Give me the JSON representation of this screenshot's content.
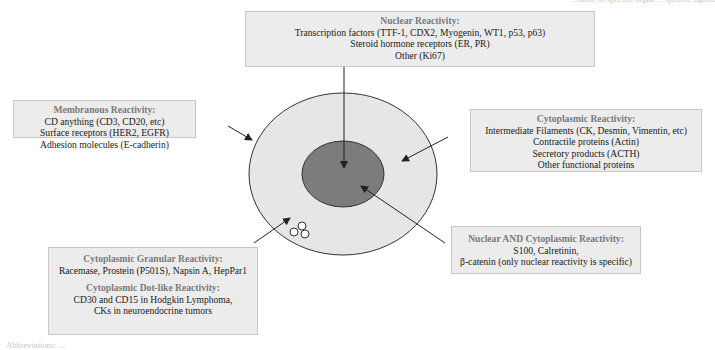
{
  "diagram": {
    "top_right_fragment": "...ation of specific organ ... specific ligand",
    "bottom_left_fragment": "Abbreviations: ...",
    "colors": {
      "box_fill": "#ececec",
      "box_border": "#c8c8c8",
      "title_text": "#7a7a7a",
      "cytoplasm_fill": "#e6e6e6",
      "nucleus_fill": "#7c7c7c",
      "outline": "#333333"
    },
    "boxes": {
      "nuclear": {
        "title": "Nuclear Reactivity:",
        "lines": [
          "Transcription factors (TTF-1, CDX2, Myogenin, WT1, p53, p63)",
          "Steroid hormone receptors (ER, PR)",
          "Other (Ki67)"
        ]
      },
      "membranous": {
        "title": "Membranous Reactivity:",
        "lines": [
          "CD anything (CD3, CD20, etc)",
          "Surface receptors (HER2, EGFR)",
          "Adhesion molecules (E-cadherin)"
        ]
      },
      "cytoplasmic": {
        "title": "Cytoplasmic Reactivity:",
        "lines": [
          "Intermediate Filaments (CK, Desmin, Vimentin, etc)",
          "Contractile proteins (Actin)",
          "Secretory products (ACTH)",
          "Other functional proteins"
        ]
      },
      "nuclear_and_cytoplasmic": {
        "title": "Nuclear AND Cytoplasmic Reactivity:",
        "lines": [
          "S100, Calretinin,",
          "β-catenin (only nuclear reactivity is specific)"
        ]
      },
      "granular": {
        "title": "Cytoplasmic Granular Reactivity:",
        "lines": [
          "Racemase, Prostein (P501S), Napsin A, HepPar1"
        ]
      },
      "dotlike": {
        "title": "Cytoplasmic Dot-like Reactivity:",
        "lines": [
          "CD30 and CD15 in Hodgkin Lymphoma,",
          "CKs in neuroendocrine tumors"
        ]
      }
    },
    "cell": {
      "parts": [
        "cell-membrane",
        "cytoplasm",
        "nucleus",
        "cytoplasmic-granules"
      ]
    }
  }
}
